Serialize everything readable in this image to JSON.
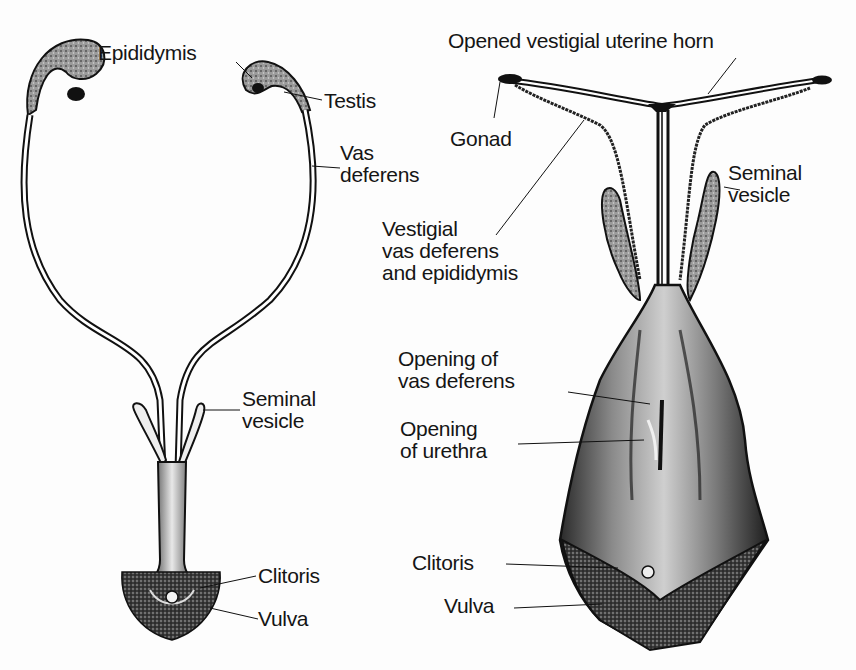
{
  "diagram": {
    "panels": [
      {
        "id": "left",
        "labels": {
          "epididymis": "Epididymis",
          "testis": "Testis",
          "vas_deferens": [
            "Vas",
            "deferens"
          ],
          "seminal_vesicle": [
            "Seminal",
            "vesicle"
          ],
          "clitoris": "Clitoris",
          "vulva": "Vulva"
        }
      },
      {
        "id": "right",
        "labels": {
          "uterine_horn": "Opened vestigial uterine horn",
          "gonad": "Gonad",
          "seminal_vesicle": [
            "Seminal",
            "vesicle"
          ],
          "vestigial_vas": [
            "Vestigial",
            "vas deferens",
            "and epididymis"
          ],
          "opening_vas": [
            "Opening of",
            "vas deferens"
          ],
          "opening_urethra": [
            "Opening",
            "of urethra"
          ],
          "clitoris": "Clitoris",
          "vulva": "Vulva"
        }
      }
    ],
    "colors": {
      "ink": "#151515",
      "background": "#fdfdfd",
      "shade": "#6a6a6a"
    }
  }
}
